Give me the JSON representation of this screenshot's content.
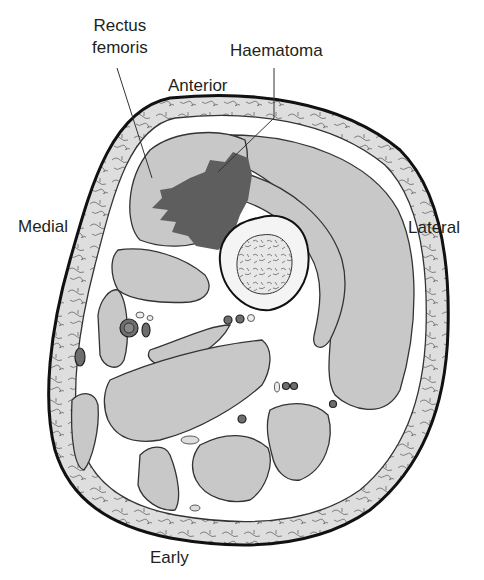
{
  "figure": {
    "stage_label": "Early",
    "orientation": {
      "anterior": "Anterior",
      "medial": "Medial",
      "lateral": "Lateral"
    },
    "annotations": [
      {
        "id": "rectus-femoris",
        "text_line1": "Rectus",
        "text_line2": "femoris"
      },
      {
        "id": "haematoma",
        "text": "Haematoma"
      }
    ],
    "colors": {
      "haematoma": "#5e5e5e",
      "muscle": "#c8c8c8",
      "fat": "#dcdcdc",
      "outline": "#1a1a1a",
      "background": "#ffffff"
    }
  }
}
